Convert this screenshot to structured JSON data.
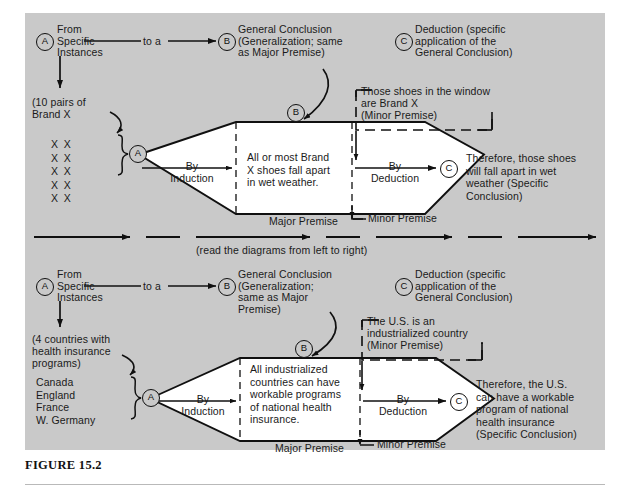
{
  "figure": {
    "caption": "FIGURE 15.2",
    "middle_note": "(read the diagrams from left to right)",
    "background_color": "#c9c9c9",
    "ink_color": "#101010"
  },
  "nodes": {
    "a": "A",
    "b": "B",
    "c": "C"
  },
  "diagram1": {
    "top_left_label": "From\nSpecific\nInstances",
    "to_a": "to a",
    "top_mid_label": "General Conclusion\n(Generalization; same\nas Major Premise)",
    "top_right_label": "Deduction (specific\napplication of the\nGeneral Conclusion)",
    "evidence_note": "(10 pairs of\nBrand X",
    "evidence_items": [
      "X  X",
      "X  X",
      "X  X",
      "X  X",
      "X  X"
    ],
    "left_arm_label": "By\nInduction",
    "center_text": "All or most Brand\nX shoes fall apart\nin wet weather.",
    "right_arm_label": "By\nDeduction",
    "major_premise_label": "Major Premise",
    "minor_premise_label": "Minor Premise",
    "minor_premise_box": "Those shoes in the window\nare Brand X\n(Minor Premise)",
    "conclusion_text": "Therefore, those shoes\nwill fall apart in wet\nweather (Specific\nConclusion)"
  },
  "diagram2": {
    "top_left_label": "From\nSpecific\nInstances",
    "to_a": "to a",
    "top_mid_label": "General Conclusion\n(Generalization;\nsame as Major\nPremise)",
    "top_right_label": "Deduction (specific\napplication of the\nGeneral Conclusion)",
    "evidence_note": "(4 countries with\nhealth insurance\nprograms)",
    "evidence_items": [
      "Canada",
      "England",
      "France",
      "W. Germany"
    ],
    "left_arm_label": "By\nInduction",
    "center_text": "All industrialized\ncountries can have\nworkable programs\nof national health\ninsurance.",
    "right_arm_label": "By\nDeduction",
    "major_premise_label": "Major Premise",
    "minor_premise_label": "Minor Premise",
    "minor_premise_box": "The U.S. is an\nindustrialized country\n(Minor Premise)",
    "conclusion_text": "Therefore, the U.S.\ncan have a workable\nprogram of national\nhealth insurance\n(Specific Conclusion)"
  }
}
